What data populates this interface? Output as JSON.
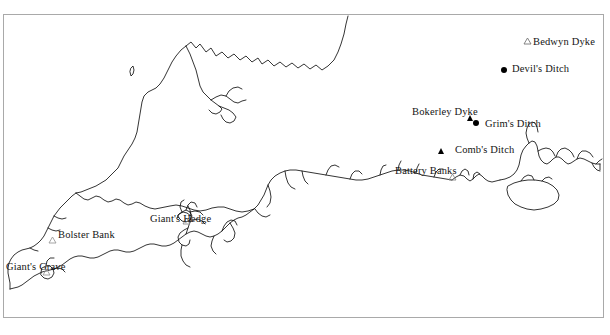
{
  "figure": {
    "caption_fragment": "",
    "region": "Southern England",
    "background_color": "#ffffff",
    "frame_color": "#a9a9a9",
    "ink_color": "#000000"
  },
  "sites": [
    {
      "id": "bedwyn-dyke",
      "label": "Bedwyn Dyke",
      "marker": "triangle-open",
      "marker_x": 527,
      "marker_y": 41,
      "label_x": 533,
      "label_y": 37
    },
    {
      "id": "devils-ditch",
      "label": "Devil's Ditch",
      "marker": "circle-filled",
      "marker_x": 504,
      "marker_y": 70,
      "label_x": 512,
      "label_y": 64
    },
    {
      "id": "bokerley-dyke",
      "label": "Bokerley Dyke",
      "marker": "triangle-filled",
      "marker_x": 470,
      "marker_y": 119,
      "label_x": 412,
      "label_y": 107
    },
    {
      "id": "grims-ditch",
      "label": "Grim's Ditch",
      "marker": "circle-filled",
      "marker_x": 476,
      "marker_y": 123,
      "label_x": 485,
      "label_y": 119
    },
    {
      "id": "combs-ditch",
      "label": "Comb's Ditch",
      "marker": "triangle-filled",
      "marker_x": 441,
      "marker_y": 151,
      "label_x": 455,
      "label_y": 145
    },
    {
      "id": "battery-banks",
      "label": "Battery Banks",
      "marker": "triangle-open",
      "marker_x": 452,
      "marker_y": 177,
      "label_x": 395,
      "label_y": 166
    },
    {
      "id": "bolster-bank",
      "label": "Bolster Bank",
      "marker": "triangle-open",
      "marker_x": 52,
      "marker_y": 240,
      "label_x": 58,
      "label_y": 230
    },
    {
      "id": "giants-hedge",
      "label": "Giant's Hedge",
      "marker": "triangle-open",
      "marker_x": 186,
      "marker_y": 221,
      "label_x": 150,
      "label_y": 214
    },
    {
      "id": "giants-grave",
      "label": "Giant's Grave",
      "marker": "triangle-open",
      "marker_x": 46,
      "marker_y": 272,
      "label_x": 6,
      "label_y": 262
    }
  ]
}
